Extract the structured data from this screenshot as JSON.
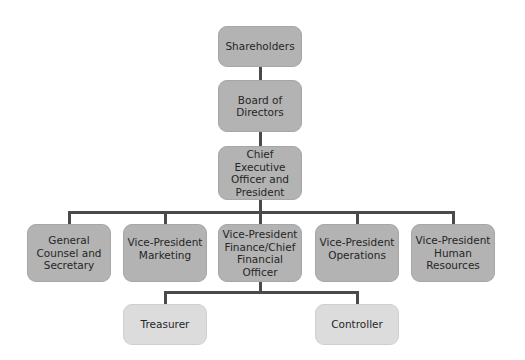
{
  "chart": {
    "type": "org-chart",
    "colors": {
      "primary_box": "#b3b3b3",
      "secondary_box": "#dcdcdc",
      "connector": "#4a4a4a"
    },
    "nodes": {
      "shareholders": "Shareholders",
      "board": "Board of\nDirectors",
      "ceo": "Chief Executive\nOfficer and\nPresident",
      "general_counsel": "General\nCounsel and\nSecretary",
      "vp_marketing": "Vice-President\nMarketing",
      "vp_finance": "Vice-President\nFinance/Chief\nFinancial Officer",
      "vp_operations": "Vice-President\nOperations",
      "vp_hr": "Vice-President\nHuman\nResources",
      "treasurer": "Treasurer",
      "controller": "Controller"
    },
    "hierarchy": {
      "Shareholders": [
        "Board of Directors"
      ],
      "Board of Directors": [
        "Chief Executive Officer and President"
      ],
      "Chief Executive Officer and President": [
        "General Counsel and Secretary",
        "Vice-President Marketing",
        "Vice-President Finance/Chief Financial Officer",
        "Vice-President Operations",
        "Vice-President Human Resources"
      ],
      "Vice-President Finance/Chief Financial Officer": [
        "Treasurer",
        "Controller"
      ]
    }
  }
}
